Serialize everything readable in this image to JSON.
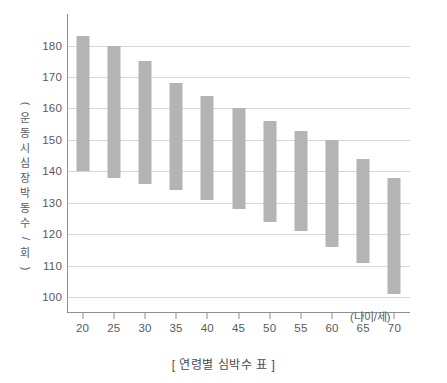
{
  "caption": "[ 연령별 심박수 표 ]",
  "y_axis_title_chars": [
    "(",
    "운",
    "동",
    "시",
    "심",
    "장",
    "박",
    "동",
    "수",
    "/",
    "회",
    ")"
  ],
  "x_axis_unit": "(나이/세)",
  "chart_data": {
    "type": "bar",
    "subtype": "floating-range-bar",
    "title": "[ 연령별 심박수 표 ]",
    "xlabel": "(나이/세)",
    "ylabel": "(운동 시 심장 박동수 / 회)",
    "xlim": [
      17.5,
      72.5
    ],
    "ylim": [
      95,
      190
    ],
    "yticks": [
      100,
      110,
      120,
      130,
      140,
      150,
      160,
      170,
      180
    ],
    "ytick_labels": [
      "100",
      "110",
      "120",
      "130",
      "140",
      "150",
      "160",
      "170",
      "180"
    ],
    "grid": "horizontal",
    "legend": "none",
    "categories": [
      "20",
      "25",
      "30",
      "35",
      "40",
      "45",
      "50",
      "55",
      "60",
      "65",
      "70"
    ],
    "xtick_labels": [
      "20",
      "25",
      "30",
      "35",
      "40",
      "45",
      "50",
      "55",
      "60",
      "65",
      "70"
    ],
    "bar_color": "#b4b4b4",
    "grid_color": "#d5d6d8",
    "axis_color": "#8e8f92",
    "series": [
      {
        "name": "운동 시 심장 박동수 범위",
        "low": [
          140,
          138,
          136,
          134,
          131,
          128,
          124,
          121,
          116,
          111,
          101
        ],
        "high": [
          183,
          180,
          175,
          168,
          164,
          160,
          156,
          153,
          150,
          144,
          138
        ]
      }
    ],
    "bars": [
      {
        "category": "20",
        "low": 140,
        "high": 183
      },
      {
        "category": "25",
        "low": 138,
        "high": 180
      },
      {
        "category": "30",
        "low": 136,
        "high": 175
      },
      {
        "category": "35",
        "low": 134,
        "high": 168
      },
      {
        "category": "40",
        "low": 131,
        "high": 164
      },
      {
        "category": "45",
        "low": 128,
        "high": 160
      },
      {
        "category": "50",
        "low": 124,
        "high": 156
      },
      {
        "category": "55",
        "low": 121,
        "high": 153
      },
      {
        "category": "60",
        "low": 116,
        "high": 150
      },
      {
        "category": "65",
        "low": 111,
        "high": 144
      },
      {
        "category": "70",
        "low": 101,
        "high": 138
      }
    ]
  }
}
